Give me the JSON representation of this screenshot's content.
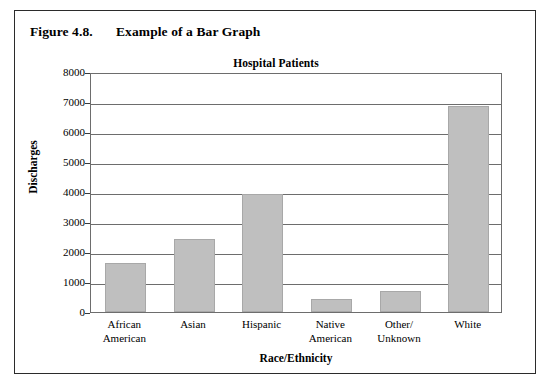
{
  "figure": {
    "number": "Figure 4.8.",
    "caption": "Example of a Bar Graph"
  },
  "chart_data": {
    "type": "bar",
    "title": "Hospital Patients",
    "xlabel": "Race/Ethnicity",
    "ylabel": "Discharges",
    "categories": [
      "African American",
      "Asian",
      "Hispanic",
      "Native American",
      "Other/ Unknown",
      "White"
    ],
    "category_lines": [
      [
        "African",
        "American"
      ],
      [
        "Asian",
        ""
      ],
      [
        "Hispanic",
        ""
      ],
      [
        "Native",
        "American"
      ],
      [
        "Other/",
        "Unknown"
      ],
      [
        "White",
        ""
      ]
    ],
    "values": [
      1620,
      2450,
      3930,
      420,
      700,
      6880
    ],
    "ylim": [
      0,
      8000
    ],
    "ytick_values": [
      0,
      1000,
      2000,
      3000,
      4000,
      5000,
      6000,
      7000,
      8000
    ],
    "ytick_labels": [
      "0",
      "1000",
      "2000",
      "3000",
      "4000",
      "5000",
      "6000",
      "7000",
      "8000"
    ],
    "grid": true,
    "legend": false,
    "bar_color": "#bfbfbf",
    "bar_edge_color": "#a8a8a8",
    "axis_color": "#6d6d6d"
  }
}
